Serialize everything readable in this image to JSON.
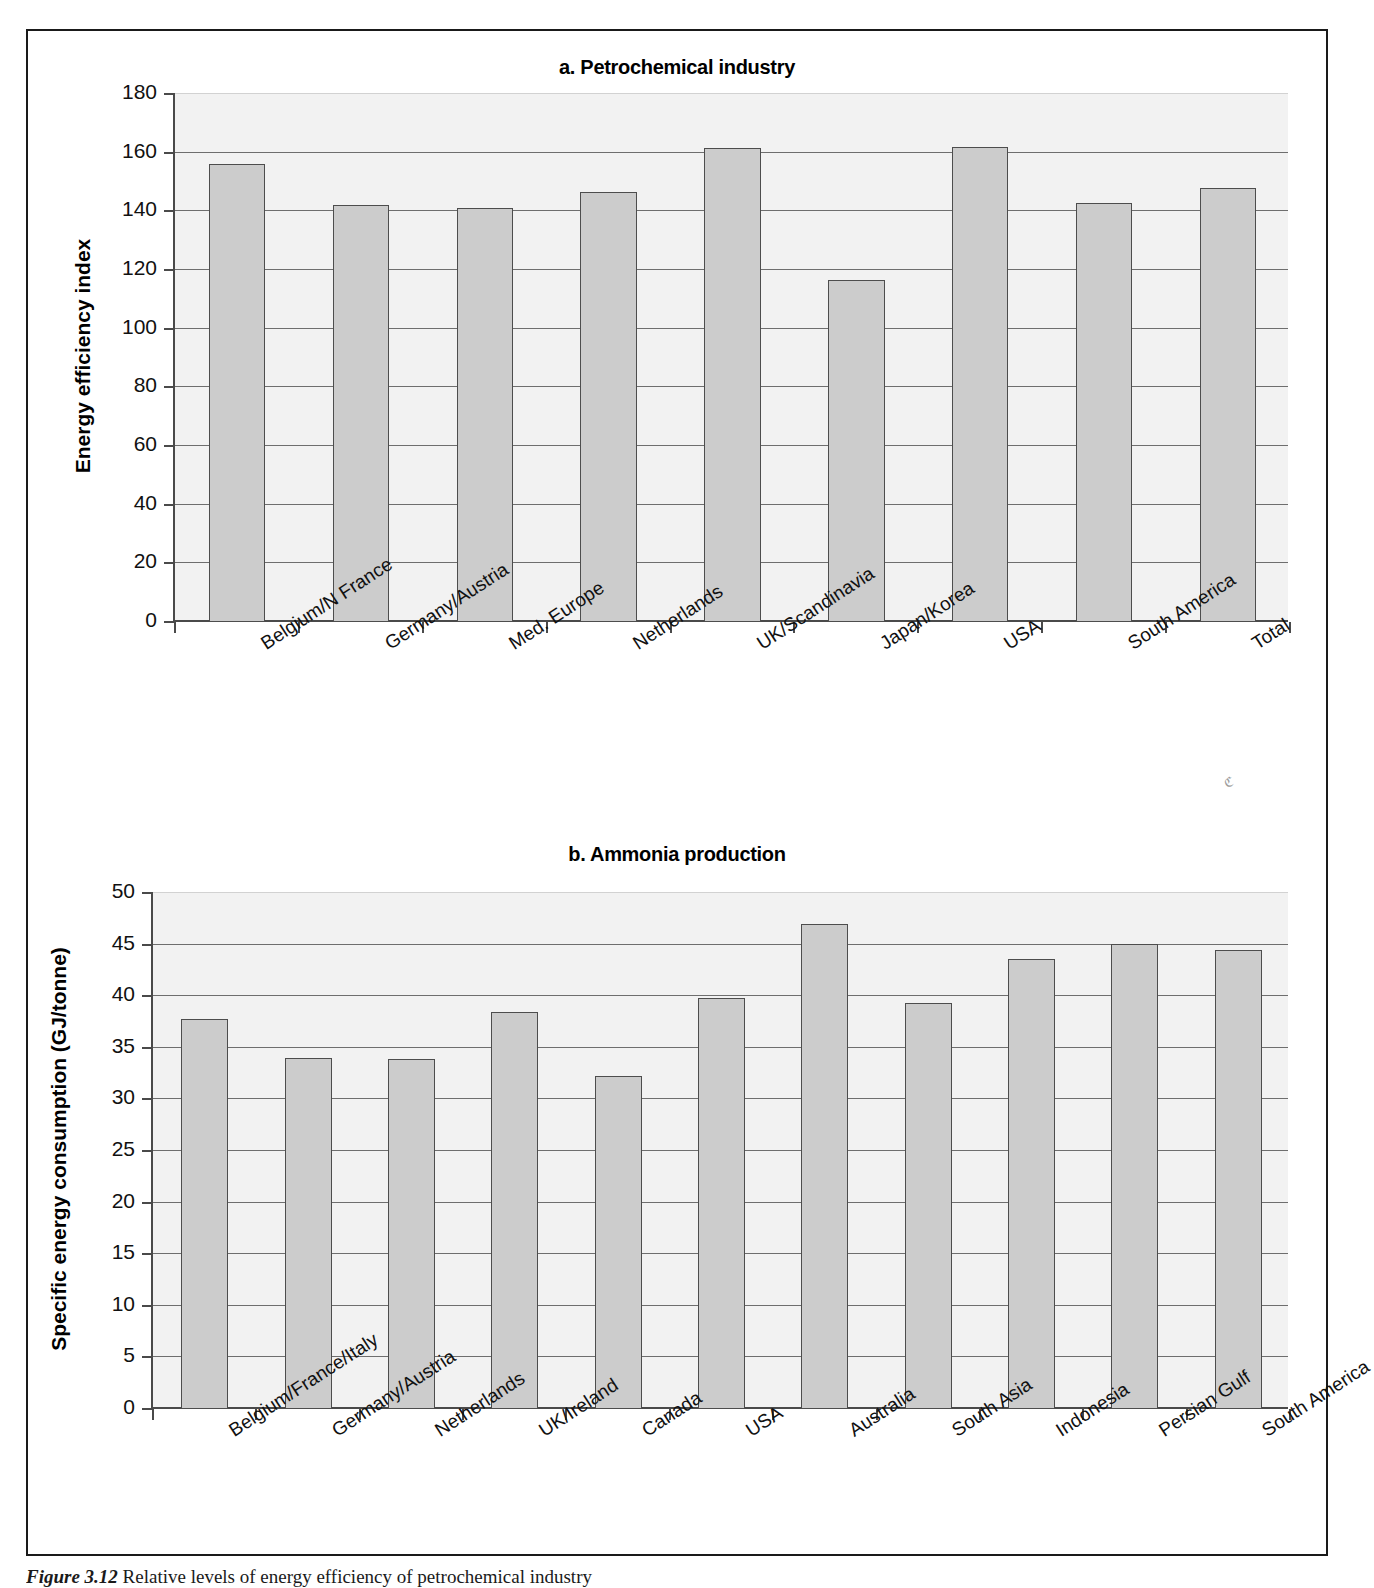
{
  "figure": {
    "caption_prefix": "Figure 3.12",
    "caption_text": "Relative levels of energy efficiency of petrochemical industry"
  },
  "chart_data": [
    {
      "type": "bar",
      "panel": "a",
      "title": "a. Petrochemical industry",
      "xlabel": "",
      "ylabel": "Energy efficiency index",
      "ylim": [
        0,
        180
      ],
      "yticks": [
        0,
        20,
        40,
        60,
        80,
        100,
        120,
        140,
        160,
        180
      ],
      "grid": true,
      "legend": "none",
      "bar_color": "#cccccc",
      "bar_edge_color": "#4d4d4d",
      "categories": [
        "Belgium/N France",
        "Germany/Austria",
        "Med. Europe",
        "Netherlands",
        "UK/Scandinavia",
        "Japan/Korea",
        "USA",
        "South America",
        "Total"
      ],
      "values": [
        156,
        142,
        141,
        146.5,
        161.5,
        116.5,
        162,
        143,
        148
      ]
    },
    {
      "type": "bar",
      "panel": "b",
      "title": "b. Ammonia production",
      "xlabel": "",
      "ylabel": "Specific energy consumption (GJ/tonne)",
      "ylim": [
        0,
        50
      ],
      "yticks": [
        0,
        5,
        10,
        15,
        20,
        25,
        30,
        35,
        40,
        45,
        50
      ],
      "grid": true,
      "legend": "none",
      "bar_color": "#cccccc",
      "bar_edge_color": "#4d4d4d",
      "categories": [
        "Belgium/France/Italy",
        "Germany/Austria",
        "Netherlands",
        "UK/Ireland",
        "Canada",
        "USA",
        "Australia",
        "South Asia",
        "Indonesia",
        "Persian Gulf",
        "South America"
      ],
      "values": [
        37.8,
        34.0,
        33.9,
        38.5,
        32.3,
        39.8,
        47.0,
        39.3,
        43.6,
        45.1,
        44.5
      ]
    }
  ]
}
